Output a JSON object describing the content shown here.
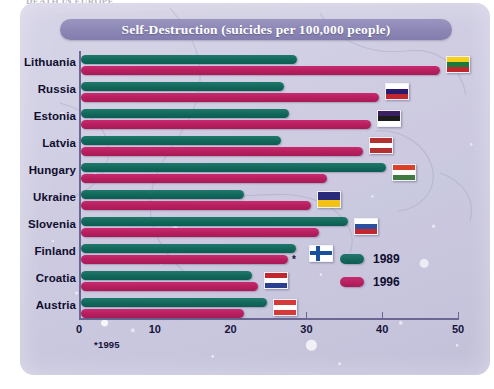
{
  "clipped_headline": "DEATH IN EUROPE",
  "title": "Self-Destruction (suicides per 100,000 people)",
  "footnote": "*1995",
  "legend": {
    "position": "inside-right",
    "entries": [
      {
        "label": "1989",
        "color": "#0d5c51"
      },
      {
        "label": "1996",
        "color": "#a81a56"
      }
    ]
  },
  "axis": {
    "ticks": [
      "0",
      "10",
      "20",
      "30",
      "40",
      "50"
    ],
    "tick_values": [
      0,
      10,
      20,
      30,
      40,
      50
    ]
  },
  "colors": {
    "series_1989": "#0d5c51",
    "series_1996": "#a81a56",
    "title_bar": "#8c86b5",
    "panel_background": "#cfcde2",
    "axis": "#6b6795",
    "label_text": "#100e2e"
  },
  "chart_data": {
    "type": "bar",
    "orientation": "horizontal",
    "title": "Self-Destruction (suicides per 100,000 people)",
    "xlabel": "",
    "ylabel": "",
    "xlim": [
      0,
      50
    ],
    "grid": false,
    "legend_position": "inside-right",
    "categories": [
      "Lithuania",
      "Russia",
      "Estonia",
      "Latvia",
      "Hungary",
      "Ukraine",
      "Slovenia",
      "Finland",
      "Croatia",
      "Austria"
    ],
    "series": [
      {
        "name": "1989",
        "color": "#0d5c51",
        "values": [
          28.5,
          26.8,
          27.5,
          26.4,
          40.2,
          21.5,
          35.2,
          28.4,
          22.6,
          24.6
        ]
      },
      {
        "name": "1996",
        "color": "#a81a56",
        "values": [
          47.3,
          39.3,
          38.2,
          37.2,
          32.5,
          30.3,
          31.4,
          27.3,
          23.3,
          21.5
        ]
      }
    ],
    "annotations": [
      {
        "category": "Finland",
        "series": "1996",
        "marker": "*",
        "note": "*1995"
      }
    ],
    "flags": [
      {
        "category": "Lithuania",
        "name": "flag-lithuania",
        "stripes": [
          "#f7d117",
          "#1a7b3c",
          "#c1272d"
        ],
        "direction": "horizontal"
      },
      {
        "category": "Russia",
        "name": "flag-russia",
        "stripes": [
          "#ffffff",
          "#2a1a6e",
          "#c1272d"
        ],
        "direction": "horizontal"
      },
      {
        "category": "Estonia",
        "name": "flag-estonia",
        "stripes": [
          "#3a2060",
          "#1b1b1b",
          "#ffffff"
        ],
        "direction": "horizontal"
      },
      {
        "category": "Latvia",
        "name": "flag-latvia",
        "stripes": [
          "#b33131",
          "#ffffff",
          "#b33131"
        ],
        "direction": "horizontal"
      },
      {
        "category": "Hungary",
        "name": "flag-hungary",
        "stripes": [
          "#d84027",
          "#ffffff",
          "#3f7a3f"
        ],
        "direction": "horizontal"
      },
      {
        "category": "Ukraine",
        "name": "flag-ukraine",
        "stripes": [
          "#2a2a7a",
          "#f2c316"
        ],
        "direction": "horizontal"
      },
      {
        "category": "Slovenia",
        "name": "flag-slovenia",
        "stripes": [
          "#ffffff",
          "#2a4fa0",
          "#c1272d"
        ],
        "direction": "horizontal"
      },
      {
        "category": "Finland",
        "name": "flag-finland",
        "stripes": [
          "#ffffff",
          "#1a4f9c",
          "#ffffff"
        ],
        "direction": "cross"
      },
      {
        "category": "Croatia",
        "name": "flag-croatia",
        "stripes": [
          "#c1272d",
          "#ffffff",
          "#2a3f8f"
        ],
        "direction": "horizontal"
      },
      {
        "category": "Austria",
        "name": "flag-austria",
        "stripes": [
          "#d43a3a",
          "#ffffff",
          "#d43a3a"
        ],
        "direction": "horizontal"
      }
    ]
  }
}
